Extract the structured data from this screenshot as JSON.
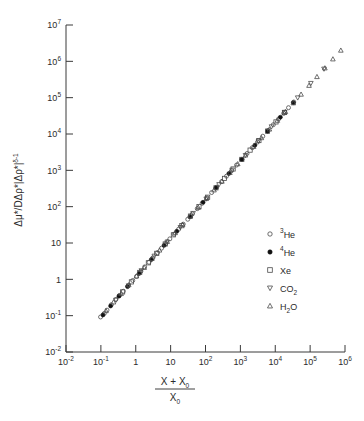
{
  "chart_data": {
    "type": "scatter",
    "title": "",
    "xlabel": "(X + X0) / X0",
    "ylabel": "Δμ* / DΔρ*|Δρ*|^(δ-1)",
    "xscale": "log",
    "yscale": "log",
    "xlim": [
      0.01,
      1000000
    ],
    "ylim": [
      0.01,
      10000000
    ],
    "grid": false,
    "legend_position": "lower-right",
    "xticks": [
      "10-2",
      "10-1",
      "1",
      "10",
      "102",
      "103",
      "104",
      "105",
      "106"
    ],
    "xtick_values": [
      0.01,
      0.1,
      1,
      10,
      100,
      1000,
      10000,
      100000,
      1000000
    ],
    "yticks": [
      "10-2",
      "10-1",
      "1",
      "10",
      "102",
      "103",
      "104",
      "105",
      "106",
      "107"
    ],
    "ytick_values": [
      0.01,
      0.1,
      1,
      10,
      100,
      1000,
      10000,
      100000,
      1000000,
      10000000
    ],
    "series": [
      {
        "name": "3He",
        "label_sup": "3",
        "label_base": "He",
        "marker": "circle-open",
        "points": [
          [
            0.098,
            0.092
          ],
          [
            0.125,
            0.115
          ],
          [
            0.15,
            0.142
          ],
          [
            0.2,
            0.2
          ],
          [
            0.27,
            0.28
          ],
          [
            0.34,
            0.36
          ],
          [
            0.44,
            0.47
          ],
          [
            0.6,
            0.66
          ],
          [
            0.82,
            0.93
          ],
          [
            1.05,
            1.2
          ],
          [
            1.4,
            1.65
          ],
          [
            1.8,
            2.2
          ],
          [
            2.4,
            2.95
          ],
          [
            3.1,
            3.9
          ],
          [
            4.2,
            5.4
          ],
          [
            5.5,
            7.2
          ],
          [
            7.2,
            9.6
          ],
          [
            9.5,
            13.0
          ],
          [
            12.5,
            17.5
          ],
          [
            17.0,
            24.0
          ],
          [
            23.0,
            33.0
          ],
          [
            31.0,
            45.0
          ],
          [
            42.0,
            63.0
          ],
          [
            58.0,
            88.0
          ],
          [
            80.0,
            124.0
          ],
          [
            110.0,
            175.0
          ],
          [
            150.0,
            245.0
          ],
          [
            210.0,
            345.0
          ],
          [
            290.0,
            490.0
          ],
          [
            400.0,
            690.0
          ],
          [
            560.0,
            980.0
          ],
          [
            780.0,
            1400.0
          ],
          [
            1100.0,
            2000.0
          ],
          [
            1550.0,
            2900.0
          ],
          [
            2200.0,
            4200.0
          ],
          [
            3100.0,
            6000.0
          ],
          [
            4400.0,
            8700.0
          ],
          [
            6200.0,
            12500.0
          ],
          [
            8800.0,
            18000.0
          ],
          [
            12500.0,
            26000.0
          ],
          [
            17500.0,
            37000.0
          ],
          [
            24000.0,
            53000.0
          ],
          [
            34000.0,
            76000.0
          ]
        ]
      },
      {
        "name": "4He",
        "label_sup": "4",
        "label_base": "He",
        "marker": "circle-filled",
        "points": [
          [
            0.115,
            0.105
          ],
          [
            0.19,
            0.185
          ],
          [
            0.33,
            0.345
          ],
          [
            0.58,
            0.63
          ],
          [
            1.25,
            1.45
          ],
          [
            2.8,
            3.5
          ],
          [
            6.5,
            8.6
          ],
          [
            15.0,
            21.0
          ],
          [
            36.0,
            53.0
          ],
          [
            85.0,
            132.0
          ],
          [
            200.0,
            330.0
          ],
          [
            470.0,
            820.0
          ],
          [
            1100.0,
            2000.0
          ],
          [
            2600.0,
            4900.0
          ],
          [
            6000.0,
            11800.0
          ],
          [
            14000.0,
            29000.0
          ],
          [
            33000.0,
            73000.0
          ]
        ]
      },
      {
        "name": "Xe",
        "label_sup": "",
        "label_base": "Xe",
        "marker": "square-open",
        "points": [
          [
            0.42,
            0.45
          ],
          [
            0.75,
            0.85
          ],
          [
            1.3,
            1.55
          ],
          [
            2.3,
            2.85
          ],
          [
            4.0,
            5.2
          ],
          [
            7.0,
            9.4
          ],
          [
            12.0,
            16.8
          ],
          [
            21.0,
            30.0
          ],
          [
            37.0,
            55.0
          ],
          [
            65.0,
            100.0
          ],
          [
            115.0,
            182.0
          ],
          [
            200.0,
            330.0
          ],
          [
            350.0,
            600.0
          ],
          [
            620.0,
            1090.0
          ],
          [
            1100.0,
            2000.0
          ],
          [
            1900.0,
            3600.0
          ],
          [
            3400.0,
            6600.0
          ],
          [
            6000.0,
            12000.0
          ],
          [
            10500.0,
            21500.0
          ],
          [
            18500.0,
            39000.0
          ]
        ]
      },
      {
        "name": "CO2",
        "label_sup": "",
        "label_base": "CO2",
        "marker": "triangle-down-open",
        "points": [
          [
            0.27,
            0.27
          ],
          [
            0.62,
            0.67
          ],
          [
            1.45,
            1.75
          ],
          [
            3.4,
            4.4
          ],
          [
            8.0,
            10.8
          ],
          [
            19.0,
            27.0
          ],
          [
            44.0,
            66.0
          ],
          [
            105.0,
            165.0
          ],
          [
            245.0,
            410.0
          ],
          [
            580.0,
            1030.0
          ],
          [
            1400.0,
            2600.0
          ],
          [
            3300.0,
            6500.0
          ],
          [
            7800.0,
            16000.0
          ],
          [
            18500.0,
            40000.0
          ],
          [
            44000.0,
            100000.0
          ],
          [
            105000.0,
            250000.0
          ],
          [
            250000.0,
            620000.0
          ]
        ]
      },
      {
        "name": "H2O",
        "label_sup": "",
        "label_base": "H2O",
        "marker": "triangle-up-open",
        "points": [
          [
            0.14,
            0.135
          ],
          [
            0.23,
            0.235
          ],
          [
            0.38,
            0.4
          ],
          [
            0.63,
            0.7
          ],
          [
            1.05,
            1.22
          ],
          [
            1.75,
            2.1
          ],
          [
            2.9,
            3.7
          ],
          [
            4.8,
            6.3
          ],
          [
            8.0,
            10.9
          ],
          [
            13.5,
            19.0
          ],
          [
            22.0,
            32.0
          ],
          [
            37.0,
            55.0
          ],
          [
            62.0,
            95.0
          ],
          [
            105.0,
            165.0
          ],
          [
            175.0,
            285.0
          ],
          [
            295.0,
            495.0
          ],
          [
            500.0,
            860.0
          ],
          [
            840.0,
            1500.0
          ],
          [
            1400.0,
            2600.0
          ],
          [
            2400.0,
            4500.0
          ],
          [
            4000.0,
            7800.0
          ],
          [
            6800.0,
            13500.0
          ],
          [
            11500.0,
            23500.0
          ],
          [
            19500.0,
            41000.0
          ],
          [
            33000.0,
            71000.0
          ],
          [
            55000.0,
            123000.0
          ],
          [
            93000.0,
            215000.0
          ],
          [
            157000.0,
            375000.0
          ],
          [
            265000.0,
            650000.0
          ],
          [
            450000.0,
            1150000.0
          ],
          [
            760000.0,
            2000000.0
          ],
          [
            1300000.0,
            3500000.0
          ],
          [
            2200000.0,
            6200000.0
          ]
        ]
      }
    ]
  },
  "axis": {
    "y_label_parts": {
      "numerator": "Δμ*",
      "denominator": "DΔρ*|Δρ*|",
      "denominator_exp": "δ-1"
    },
    "x_label_parts": {
      "numerator": "X + X",
      "numerator_sub": "0",
      "denominator": "X",
      "denominator_sub": "0"
    }
  },
  "legend": {
    "entries": [
      {
        "sup": "3",
        "base": "He",
        "marker": "circle-open"
      },
      {
        "sup": "4",
        "base": "He",
        "marker": "circle-filled"
      },
      {
        "sup": "",
        "base": "Xe",
        "marker": "square-open"
      },
      {
        "sup": "",
        "base": "CO",
        "sub": "2",
        "marker": "triangle-down-open"
      },
      {
        "sup": "",
        "base": "H",
        "sub": "2",
        "base2": "O",
        "marker": "triangle-up-open"
      }
    ]
  },
  "colors": {
    "axis": "#3a3a3a",
    "text": "#2b2b2b",
    "marker_open": "#4a4a4a",
    "marker_filled": "#111111",
    "background": "#ffffff"
  }
}
